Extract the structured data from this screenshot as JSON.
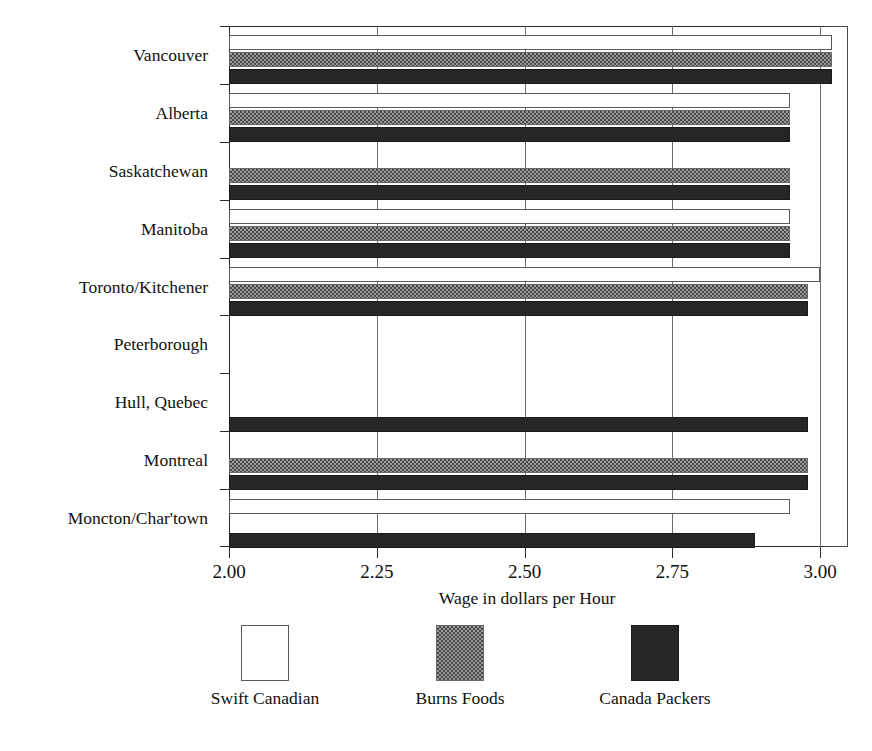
{
  "chart_data": {
    "type": "bar",
    "orientation": "horizontal",
    "title": "",
    "xlabel": "Wage in dollars per Hour",
    "ylabel": "",
    "xlim": [
      2.0,
      3.05
    ],
    "xticks": [
      2.0,
      2.25,
      2.5,
      2.75,
      3.0
    ],
    "xtick_labels": [
      "2.00",
      "2.25",
      "2.50",
      "2.75",
      "3.00"
    ],
    "grid": true,
    "legend_position": "bottom",
    "categories": [
      "Vancouver",
      "Alberta",
      "Saskatchewan",
      "Manitoba",
      "Toronto/Kitchener",
      "Peterborough",
      "Hull, Quebec",
      "Montreal",
      "Moncton/Char'town"
    ],
    "series": [
      {
        "name": "Swift Canadian",
        "swatch": "white-open-square",
        "color": "#ffffff",
        "values": [
          3.02,
          2.95,
          null,
          2.95,
          3.0,
          null,
          null,
          null,
          2.95
        ]
      },
      {
        "name": "Burns Foods",
        "swatch": "gray-checker-square",
        "color": "#9a9a9a",
        "values": [
          3.02,
          2.95,
          2.95,
          2.95,
          2.98,
          null,
          null,
          2.98,
          null
        ]
      },
      {
        "name": "Canada Packers",
        "swatch": "black-filled-square",
        "color": "#262626",
        "values": [
          3.02,
          2.95,
          2.95,
          2.95,
          2.98,
          null,
          2.98,
          2.98,
          2.89
        ]
      }
    ]
  },
  "legend": {
    "items": [
      {
        "label": "Swift Canadian",
        "swatch": "white-open-square"
      },
      {
        "label": "Burns Foods",
        "swatch": "gray-checker-square"
      },
      {
        "label": "Canada Packers",
        "swatch": "black-filled-square"
      }
    ]
  }
}
